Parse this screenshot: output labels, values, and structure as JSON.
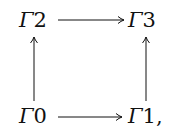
{
  "diagram": {
    "type": "commutative-square",
    "nodes": [
      {
        "id": "n2",
        "symbol": "Γ",
        "index": "2",
        "suffix": ""
      },
      {
        "id": "n3",
        "symbol": "Γ",
        "index": "3",
        "suffix": ""
      },
      {
        "id": "n0",
        "symbol": "Γ",
        "index": "0",
        "suffix": ""
      },
      {
        "id": "n1",
        "symbol": "Γ",
        "index": "1",
        "suffix": ","
      }
    ],
    "edges": [
      {
        "from": "Γ2",
        "to": "Γ3",
        "direction": "right"
      },
      {
        "from": "Γ0",
        "to": "Γ1",
        "direction": "right"
      },
      {
        "from": "Γ0",
        "to": "Γ2",
        "direction": "up"
      },
      {
        "from": "Γ1",
        "to": "Γ3",
        "direction": "up"
      }
    ],
    "colors": {
      "ink": "#111111",
      "background": "#ffffff"
    }
  }
}
